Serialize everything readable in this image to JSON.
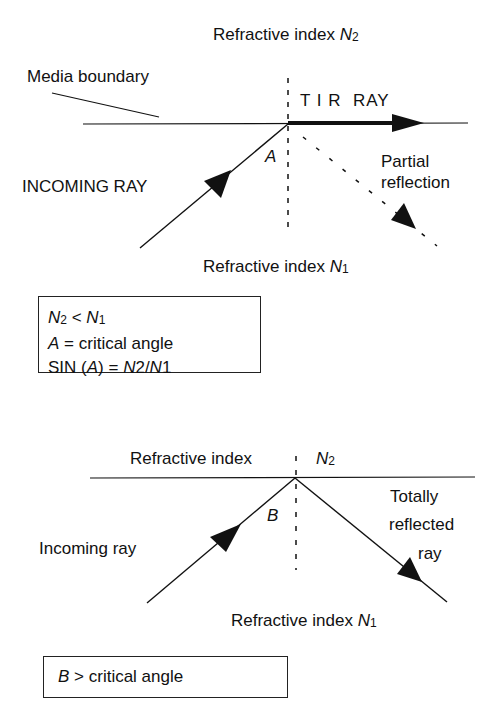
{
  "top_diagram": {
    "label_n2_prefix": "Refractive index ",
    "label_n2_var": "N",
    "label_n2_sub": "2",
    "label_boundary": "Media boundary",
    "label_tir": "T I R  RAY",
    "label_angle": "A",
    "label_incoming": "INCOMING RAY",
    "label_partial_1": "Partial",
    "label_partial_2": "reflection",
    "label_n1_prefix": "Refractive index ",
    "label_n1_var": "N",
    "label_n1_sub": "1"
  },
  "box_1": {
    "line_1": {
      "a_var": "N",
      "a_sub": "2",
      "op": " < ",
      "b_var": "N",
      "b_sub": "1"
    },
    "line_2": {
      "var": "A",
      "text": " = critical angle"
    },
    "line_3": {
      "prefix": "SIN (",
      "var": "A",
      "mid": ") = ",
      "n2": "N",
      "n2_sub": "2",
      "slash": "/",
      "n1": "N",
      "n1_sub": "1"
    }
  },
  "bottom_diagram": {
    "label_n2_prefix": "Refractive index",
    "label_n2_var": "N",
    "label_n2_sub": "2",
    "label_angle": "B",
    "label_incoming": "Incoming ray",
    "label_reflected_1": "Totally",
    "label_reflected_2": "reflected",
    "label_reflected_3": "ray",
    "label_n1_prefix": "Refractive index ",
    "label_n1_var": "N",
    "label_n1_sub": "1"
  },
  "box_2": {
    "var": "B",
    "text": " > critical angle"
  },
  "colors": {
    "ink": "#111111",
    "background": "#ffffff"
  }
}
